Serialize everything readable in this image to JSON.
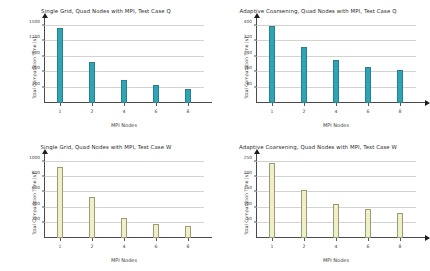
{
  "chart_data": [
    {
      "type": "bar",
      "panel": "top-left",
      "title": "Single Grid, Quad Nodes with MPI, Test Case Q",
      "xlabel": "MPI Nodes",
      "ylabel": "Total Computation Time [s]",
      "categories": [
        "1",
        "2",
        "4",
        "6",
        "8"
      ],
      "values": [
        1470,
        800,
        440,
        350,
        280
      ],
      "yticks": [
        300,
        600,
        900,
        1200,
        1500
      ],
      "ylim": [
        0,
        1560
      ],
      "bar_color": "#2ea5b7",
      "grid": true,
      "legend": "none"
    },
    {
      "type": "bar",
      "panel": "top-right",
      "title": "Adaptive Coarsening, Quad Nodes with MPI, Test Case Q",
      "xlabel": "MPI Nodes",
      "ylabel": "Total Computation Time [s]",
      "categories": [
        "1",
        "2",
        "4",
        "6",
        "8"
      ],
      "values": [
        400,
        290,
        225,
        185,
        172
      ],
      "yticks": [
        80,
        160,
        240,
        320,
        400
      ],
      "ylim": [
        0,
        416
      ],
      "bar_color": "#2ea5b7",
      "grid": true,
      "legend": "none"
    },
    {
      "type": "bar",
      "panel": "bottom-left",
      "title": "Single Grid, Quad Nodes with MPI, Test Case W",
      "xlabel": "MPI Nodes",
      "ylabel": "Total Computation Time [s]",
      "categories": [
        "1",
        "2",
        "4",
        "6",
        "8"
      ],
      "values": [
        940,
        540,
        270,
        190,
        155
      ],
      "yticks": [
        200,
        400,
        600,
        800,
        1000
      ],
      "ylim": [
        0,
        1040
      ],
      "bar_color": "#f1efc6",
      "grid": true,
      "legend": "none"
    },
    {
      "type": "bar",
      "panel": "bottom-right",
      "title": "Adaptive Coarsening, Quad Nodes with MPI, Test Case W",
      "xlabel": "MPI Nodes",
      "ylabel": "Total Computation Time [s]",
      "categories": [
        "1",
        "2",
        "4",
        "6",
        "8"
      ],
      "values": [
        248,
        158,
        113,
        95,
        82
      ],
      "yticks": [
        50,
        100,
        150,
        200,
        250
      ],
      "ylim": [
        0,
        260
      ],
      "bar_color": "#f1efc6",
      "grid": true,
      "legend": "none"
    }
  ]
}
